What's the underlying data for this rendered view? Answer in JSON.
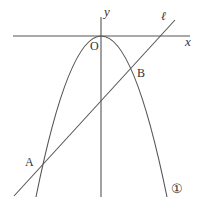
{
  "diagram": {
    "type": "coordinate-plane",
    "axes": {
      "x_label": "x",
      "y_label": "y",
      "origin_label": "O"
    },
    "curves": [
      {
        "id": "parabola",
        "label": "①",
        "description": "downward-opening parabola with vertex at origin"
      },
      {
        "id": "line",
        "label": "ℓ",
        "description": "straight line with positive slope"
      }
    ],
    "points": [
      {
        "name": "A",
        "description": "left intersection of line ℓ and parabola ①"
      },
      {
        "name": "B",
        "description": "right intersection of line ℓ and parabola ①"
      },
      {
        "name": "O",
        "description": "origin"
      }
    ],
    "colors": {
      "stroke": "#555555",
      "text": "#333333",
      "background": "#ffffff"
    }
  }
}
